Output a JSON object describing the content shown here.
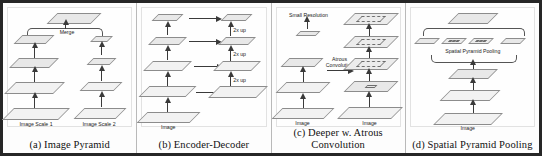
{
  "figure": {
    "panels": [
      {
        "id": "image-pyramid",
        "caption": "(a) Image Pyramid",
        "labels": {
          "merge": "Merge",
          "scale1": "Image Scale 1",
          "scale2": "Image Scale 2"
        }
      },
      {
        "id": "encoder-decoder",
        "caption": "(b) Encoder-Decoder",
        "labels": {
          "image": "Image",
          "up1": "2x up",
          "up2": "2x up",
          "up3": "2x up"
        }
      },
      {
        "id": "deeper-atrous-convolution",
        "caption": "(c) Deeper w. Atrous Convolution",
        "labels": {
          "small_resolution": "Small Resolution",
          "atrous_convolution": "Atrous Convolution",
          "image_left": "Image",
          "image_right": "Image"
        }
      },
      {
        "id": "spatial-pyramid-pooling",
        "caption": "(d) Spatial Pyramid Pooling",
        "labels": {
          "spp": "Spatial Pyramid Pooling",
          "image": "Image"
        }
      }
    ]
  }
}
